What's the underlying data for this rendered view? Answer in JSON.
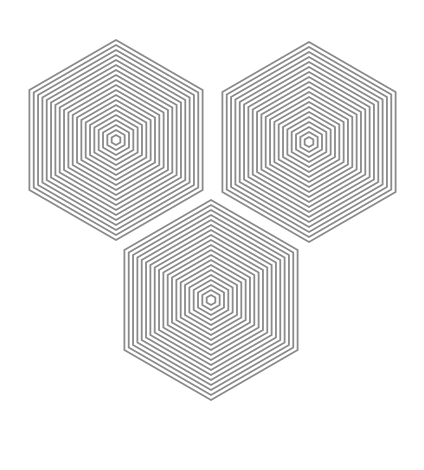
{
  "figure": {
    "background": "#ffffff",
    "stroke_color": "#8a8a8a",
    "stroke_width": 1.8,
    "orientation": "pointy-top",
    "ring_count": 20,
    "inner_radius": 5,
    "ring_step": 5,
    "hexagons": [
      {
        "name": "top-left-hexagon",
        "cx": 116,
        "cy": 140
      },
      {
        "name": "top-right-hexagon",
        "cx": 309,
        "cy": 142
      },
      {
        "name": "bottom-hexagon",
        "cx": 211,
        "cy": 300
      }
    ]
  }
}
